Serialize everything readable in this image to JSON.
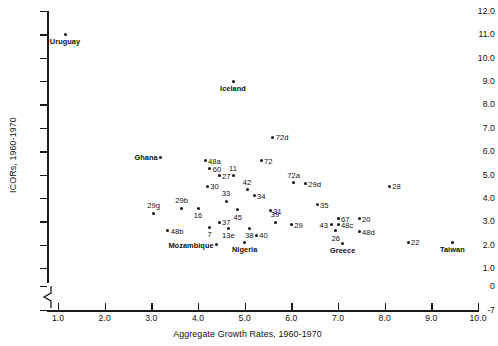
{
  "chart_data": {
    "type": "scatter",
    "title": "",
    "xlabel": "Aggregate Growth Rates, 1960-1970",
    "ylabel": "ICORs, 1960-1970",
    "xlim": [
      1.0,
      10.0
    ],
    "ylim": [
      -7,
      12.0
    ],
    "grid": false,
    "legend": "none",
    "y_axis_break": true,
    "xticks": [
      "1.0",
      "2.0",
      "3.0",
      "4.0",
      "5.0",
      "6.0",
      "7.0",
      "8.0",
      "9.0",
      "10.0"
    ],
    "yticks": [
      "12.0",
      "11.0",
      "10.0",
      "9.0",
      "8.0",
      "7.0",
      "6.0",
      "5.0",
      "4.0",
      "3.0",
      "2.0",
      "1.0",
      "0",
      "-7"
    ],
    "points": [
      {
        "label": "Uruguay",
        "x": 1.15,
        "y": 11.0,
        "pos": "below",
        "bold": true
      },
      {
        "label": "Iceland",
        "x": 4.75,
        "y": 9.0,
        "pos": "below",
        "bold": true
      },
      {
        "label": "72d",
        "x": 5.6,
        "y": 6.6,
        "pos": "right",
        "bold": false
      },
      {
        "label": "Ghana",
        "x": 3.2,
        "y": 5.75,
        "pos": "left",
        "bold": true
      },
      {
        "label": "72",
        "x": 5.35,
        "y": 5.6,
        "pos": "right",
        "bold": false
      },
      {
        "label": "48a",
        "x": 4.15,
        "y": 5.6,
        "pos": "right",
        "bold": false
      },
      {
        "label": "60",
        "x": 4.25,
        "y": 5.25,
        "pos": "right",
        "bold": false
      },
      {
        "label": "27",
        "x": 4.45,
        "y": 4.95,
        "pos": "right",
        "bold": false
      },
      {
        "label": "11",
        "x": 4.75,
        "y": 4.95,
        "pos": "above",
        "bold": false
      },
      {
        "label": "72a",
        "x": 6.05,
        "y": 4.65,
        "pos": "above",
        "bold": false
      },
      {
        "label": "29d",
        "x": 6.3,
        "y": 4.6,
        "pos": "right",
        "bold": false
      },
      {
        "label": "28",
        "x": 8.1,
        "y": 4.5,
        "pos": "right",
        "bold": false
      },
      {
        "label": "30",
        "x": 4.2,
        "y": 4.5,
        "pos": "right",
        "bold": false
      },
      {
        "label": "42",
        "x": 5.05,
        "y": 4.35,
        "pos": "above",
        "bold": false
      },
      {
        "label": "34",
        "x": 5.2,
        "y": 4.1,
        "pos": "right",
        "bold": false
      },
      {
        "label": "33",
        "x": 4.6,
        "y": 3.85,
        "pos": "above",
        "bold": false
      },
      {
        "label": "35",
        "x": 6.55,
        "y": 3.7,
        "pos": "right",
        "bold": false
      },
      {
        "label": "29b",
        "x": 3.65,
        "y": 3.55,
        "pos": "above",
        "bold": false
      },
      {
        "label": "16",
        "x": 4.0,
        "y": 3.55,
        "pos": "below",
        "bold": false
      },
      {
        "label": "45",
        "x": 4.85,
        "y": 3.5,
        "pos": "below",
        "bold": false
      },
      {
        "label": "31",
        "x": 5.55,
        "y": 3.45,
        "pos": "right",
        "bold": false
      },
      {
        "label": "29g",
        "x": 3.05,
        "y": 3.35,
        "pos": "above",
        "bold": false
      },
      {
        "label": "67",
        "x": 7.0,
        "y": 3.1,
        "pos": "right",
        "bold": false
      },
      {
        "label": "20",
        "x": 7.45,
        "y": 3.1,
        "pos": "right",
        "bold": false
      },
      {
        "label": "37",
        "x": 4.45,
        "y": 2.95,
        "pos": "right",
        "bold": false
      },
      {
        "label": "39",
        "x": 5.65,
        "y": 2.95,
        "pos": "above",
        "bold": false
      },
      {
        "label": "29",
        "x": 6.0,
        "y": 2.85,
        "pos": "right",
        "bold": false
      },
      {
        "label": "43",
        "x": 6.85,
        "y": 2.85,
        "pos": "left",
        "bold": false
      },
      {
        "label": "48c",
        "x": 7.0,
        "y": 2.85,
        "pos": "right",
        "bold": false
      },
      {
        "label": "7",
        "x": 4.25,
        "y": 2.75,
        "pos": "below",
        "bold": false
      },
      {
        "label": "38",
        "x": 5.1,
        "y": 2.7,
        "pos": "below",
        "bold": false
      },
      {
        "label": "13e",
        "x": 4.65,
        "y": 2.7,
        "pos": "below",
        "bold": false
      },
      {
        "label": "48b",
        "x": 3.35,
        "y": 2.6,
        "pos": "right",
        "bold": false
      },
      {
        "label": "26",
        "x": 6.95,
        "y": 2.6,
        "pos": "below",
        "bold": false
      },
      {
        "label": "48d",
        "x": 7.45,
        "y": 2.55,
        "pos": "right",
        "bold": false
      },
      {
        "label": "40",
        "x": 5.25,
        "y": 2.4,
        "pos": "right",
        "bold": false
      },
      {
        "label": "Nigeria",
        "x": 5.0,
        "y": 2.1,
        "pos": "below",
        "bold": true
      },
      {
        "label": "Mozambique",
        "x": 4.4,
        "y": 2.0,
        "pos": "left",
        "bold": true
      },
      {
        "label": "22",
        "x": 8.5,
        "y": 2.1,
        "pos": "right",
        "bold": false
      },
      {
        "label": "Greece",
        "x": 7.1,
        "y": 2.05,
        "pos": "below",
        "bold": true
      },
      {
        "label": "Taiwan",
        "x": 9.45,
        "y": 2.1,
        "pos": "below",
        "bold": true
      }
    ]
  }
}
